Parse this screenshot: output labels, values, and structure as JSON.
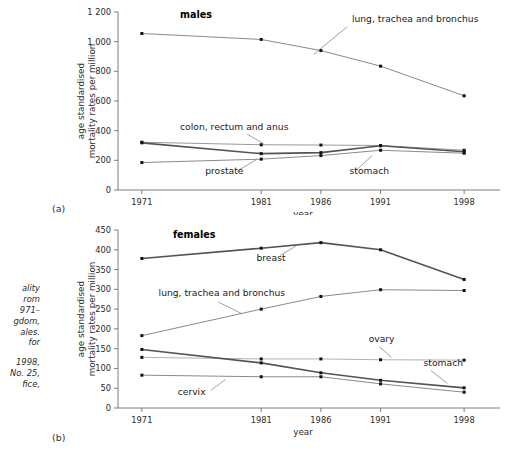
{
  "figure": {
    "caption_line1": "ality\nrom\n971–\ngdom,\nales.\nfor",
    "caption_line2": "1998,\nNo. 25,\nfice,",
    "panel_a_tag": "(a)",
    "panel_b_tag": "(b)"
  },
  "chart_data": [
    {
      "id": "males",
      "type": "line",
      "title": "males",
      "xlabel": "year",
      "ylabel": "age standardised\nmortality rates per million",
      "x": [
        1971,
        1981,
        1986,
        1991,
        1998
      ],
      "xticklabels": [
        "1971",
        "1981",
        "1986",
        "1991",
        "1998"
      ],
      "xlim": [
        1969,
        2000
      ],
      "ylim": [
        0,
        1200
      ],
      "yticks": [
        0,
        200,
        400,
        600,
        800,
        1000,
        1200
      ],
      "yticklabels": [
        "0",
        "200",
        "400",
        "600",
        "800",
        "1 000",
        "1 200"
      ],
      "grid": false,
      "legend": "inline-annotations",
      "series": [
        {
          "name": "lung, trachea and bronchus",
          "values": [
            1055,
            1015,
            940,
            835,
            635
          ],
          "color": "#8a8a8a",
          "width": 1.0,
          "label_x": 1988.6,
          "label_y": 1135,
          "leader": [
            [
              1988.2,
              1100
            ],
            [
              1985.4,
              915
            ]
          ]
        },
        {
          "name": "colon, rectum and anus",
          "values": [
            322,
            305,
            303,
            300,
            268
          ],
          "color": "#9a9a9a",
          "width": 1.0,
          "label_x": 1974.2,
          "label_y": 405,
          "leader": [
            [
              1979.8,
              378
            ],
            [
              1981.2,
              312
            ]
          ]
        },
        {
          "name": "stomach",
          "values": [
            318,
            245,
            252,
            298,
            258
          ],
          "color": "#545454",
          "width": 1.6,
          "label_x": 1988.4,
          "label_y": 105,
          "leader": [
            [
              1988.9,
              130
            ],
            [
              1990.3,
              232
            ]
          ]
        },
        {
          "name": "prostate",
          "values": [
            185,
            208,
            232,
            268,
            248
          ],
          "color": "#8a8a8a",
          "width": 1.0,
          "label_x": 1976.3,
          "label_y": 105,
          "leader": [
            [
              1979.0,
              128
            ],
            [
              1980.6,
              205
            ]
          ]
        }
      ]
    },
    {
      "id": "females",
      "type": "line",
      "title": "females",
      "xlabel": "year",
      "ylabel": "age standardised\nmortality rates per million",
      "x": [
        1971,
        1981,
        1986,
        1991,
        1998
      ],
      "xticklabels": [
        "1971",
        "1981",
        "1986",
        "1991",
        "1998"
      ],
      "xlim": [
        1969,
        2000
      ],
      "ylim": [
        0,
        450
      ],
      "yticks": [
        0,
        50,
        100,
        150,
        200,
        250,
        300,
        350,
        400,
        450
      ],
      "yticklabels": [
        "0",
        "50",
        "100",
        "150",
        "200",
        "250",
        "300",
        "350",
        "400",
        "450"
      ],
      "grid": false,
      "legend": "inline-annotations",
      "series": [
        {
          "name": "breast",
          "values": [
            378,
            404,
            418,
            400,
            325
          ],
          "color": "#545454",
          "width": 1.6,
          "label_x": 1980.6,
          "label_y": 372,
          "leader": [
            [
              1982.6,
              386
            ],
            [
              1983.9,
              409
            ]
          ]
        },
        {
          "name": "lung, trachea and bronchus",
          "values": [
            183,
            250,
            282,
            299,
            297
          ],
          "color": "#8a8a8a",
          "width": 1.0,
          "label_x": 1972.4,
          "label_y": 283,
          "leader": [
            [
              1977.4,
              268
            ],
            [
              1979.4,
              238
            ]
          ]
        },
        {
          "name": "ovary",
          "values": [
            128,
            124,
            124,
            122,
            121
          ],
          "color": "#a8a8a8",
          "width": 0.9,
          "label_x": 1990.0,
          "label_y": 168,
          "leader": [
            [
              1990.9,
              155
            ],
            [
              1991.9,
              128
            ]
          ]
        },
        {
          "name": "stomach",
          "values": [
            148,
            114,
            89,
            70,
            51
          ],
          "color": "#545454",
          "width": 1.6,
          "label_x": 1994.6,
          "label_y": 106,
          "leader": [
            [
              1995.2,
              95
            ],
            [
              1996.6,
              62
            ]
          ]
        },
        {
          "name": "cervix",
          "values": [
            83,
            79,
            79,
            61,
            40
          ],
          "color": "#8a8a8a",
          "width": 1.0,
          "label_x": 1974.0,
          "label_y": 32,
          "leader": [
            [
              1976.8,
              45
            ],
            [
              1978.0,
              72
            ]
          ]
        }
      ]
    }
  ]
}
